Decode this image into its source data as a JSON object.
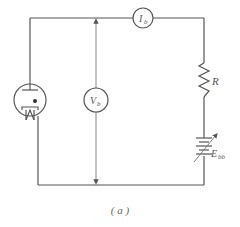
{
  "diagram": {
    "type": "circuit-schematic",
    "components": [
      {
        "id": "tube",
        "kind": "triode-vacuum-tube"
      },
      {
        "id": "ammeter",
        "kind": "meter",
        "label_main": "I",
        "label_sub": "b"
      },
      {
        "id": "voltmeter",
        "kind": "meter",
        "label_main": "V",
        "label_sub": "b"
      },
      {
        "id": "resistor",
        "kind": "resistor",
        "label": "R"
      },
      {
        "id": "battery",
        "kind": "variable-battery",
        "label_main": "E",
        "label_sub": "bb"
      }
    ],
    "caption": "( a )"
  },
  "colors": {
    "line": "#555555",
    "background": "#ffffff"
  }
}
